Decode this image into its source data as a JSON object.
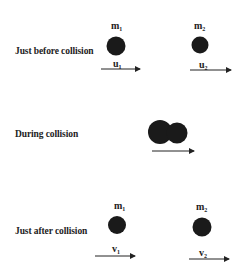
{
  "diagram": {
    "stages": [
      {
        "label": "Just before collision",
        "bodies": [
          {
            "mass": "m",
            "mass_sub": "1",
            "velocity": "u",
            "velocity_sub": "1"
          },
          {
            "mass": "m",
            "mass_sub": "2",
            "velocity": "u",
            "velocity_sub": "2"
          }
        ]
      },
      {
        "label": "During collision",
        "bodies": []
      },
      {
        "label": "Just after collision",
        "bodies": [
          {
            "mass": "m",
            "mass_sub": "1",
            "velocity": "v",
            "velocity_sub": "1"
          },
          {
            "mass": "m",
            "mass_sub": "2",
            "velocity": "v",
            "velocity_sub": "2"
          }
        ]
      }
    ],
    "colors": {
      "ball": "#1a1a1a",
      "arrow": "#222222",
      "text": "#222222"
    }
  }
}
